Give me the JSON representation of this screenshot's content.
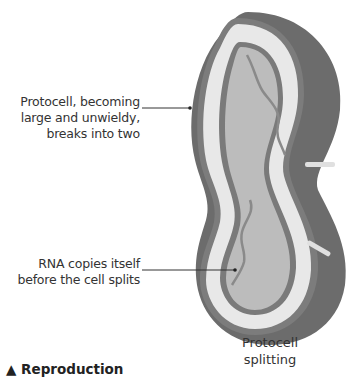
{
  "figure": {
    "callouts": [
      {
        "id": "protocell-growth",
        "lines": [
          "Protocell, becoming",
          "large and unwieldy,",
          "breaks into two"
        ]
      },
      {
        "id": "rna-copy",
        "lines": [
          "RNA copies itself",
          "before the cell splits"
        ]
      }
    ],
    "caption": {
      "lines": [
        "Protocell",
        "splitting"
      ]
    },
    "section_heading": {
      "marker": "▲",
      "text": "Reproduction"
    },
    "colors": {
      "outer_shell": "#6f6f6f",
      "membrane_dots": "#7a7a7a",
      "membrane_light": "#e6e6e6",
      "interior": "#bdbdbd",
      "rna_strand": "#888888",
      "leader_line": "#333333"
    }
  }
}
